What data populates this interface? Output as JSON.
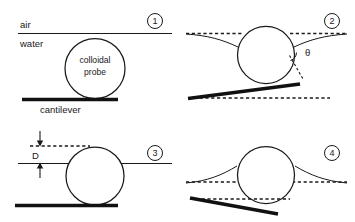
{
  "figure": {
    "background_color": "#ffffff",
    "line_color": "#1a1a1a",
    "panel_count": 4
  },
  "panels": [
    {
      "number": "1",
      "caption_number": "1",
      "labels": {
        "air": "air",
        "water": "water",
        "probe_line1": "colloidal",
        "probe_line2": "probe",
        "cantilever": "cantilever"
      },
      "description": "Flat air-water interface above an undeformed cantilever carrying a colloidal probe sphere fully in water."
    },
    {
      "number": "2",
      "caption_number": "2",
      "labels": {
        "theta": "θ"
      },
      "description": "Sphere pinned at the interface; meniscus pulled downward, contact angle theta marked, cantilever bent upward."
    },
    {
      "number": "3",
      "caption_number": "3",
      "labels": {
        "distance": "D"
      },
      "description": "Sphere approaching the flat interface; separation distance D indicated between dashed reference line and the water surface."
    },
    {
      "number": "4",
      "caption_number": "4",
      "labels": {},
      "description": "Sphere withdrawn; meniscus rises up around the sphere and the cantilever bends downward."
    }
  ],
  "symbols": {
    "contact_angle": "θ",
    "separation": "D"
  }
}
